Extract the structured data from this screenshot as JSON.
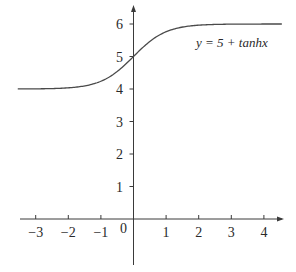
{
  "chart_data": {
    "type": "line",
    "title": "",
    "xlabel": "",
    "ylabel": "",
    "annotation": "y = 5 + tanhx",
    "function": "y = 5 + tanh(x)",
    "xlim": [
      -3.5,
      4.6
    ],
    "ylim": [
      -1.1,
      6.6
    ],
    "grid": false,
    "legend": "none",
    "x_ticks": [
      -3,
      -2,
      -1,
      0,
      1,
      2,
      3,
      4
    ],
    "x_tick_labels": [
      "−3",
      "−2",
      "−1",
      "0",
      "1",
      "2",
      "3",
      "4"
    ],
    "y_ticks": [
      1,
      2,
      3,
      4,
      5,
      6
    ],
    "y_tick_labels": [
      "1",
      "2",
      "3",
      "4",
      "5",
      "6"
    ],
    "series": [
      {
        "name": "y = 5 + tanhx",
        "x": [
          -3.5,
          -3,
          -2.5,
          -2,
          -1.5,
          -1,
          -0.5,
          0,
          0.5,
          1,
          1.5,
          2,
          2.5,
          3,
          3.5,
          4,
          4.5
        ],
        "values": [
          4.002,
          4.005,
          4.013,
          4.036,
          4.095,
          4.238,
          4.538,
          5.0,
          5.462,
          5.762,
          5.905,
          5.964,
          5.987,
          5.995,
          5.998,
          5.999,
          6.0
        ]
      }
    ],
    "asymptotes": [
      4,
      6
    ]
  },
  "colors": {
    "axis": "#3a3a3a",
    "curve": "#4a4a4a",
    "text": "#2a2a2a",
    "background": "#ffffff"
  }
}
